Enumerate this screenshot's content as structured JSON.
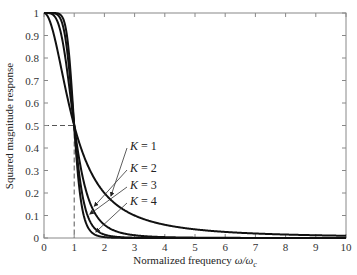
{
  "chart_data": {
    "type": "line",
    "title": "",
    "xlabel": "Normalized frequency ω/ω_c",
    "xlabel_main": "Normalized frequency ",
    "xlabel_omega": "ω/ω",
    "xlabel_sub": "c",
    "ylabel": "Squared magnitude response",
    "xlim": [
      0,
      10
    ],
    "ylim": [
      0,
      1
    ],
    "xticks": [
      0,
      1,
      2,
      3,
      4,
      5,
      6,
      7,
      8,
      9,
      10
    ],
    "yticks": [
      0,
      0.1,
      0.2,
      0.3,
      0.4,
      0.5,
      0.6,
      0.7,
      0.8,
      0.9,
      1
    ],
    "ytick_labels": [
      "0",
      "0.1",
      "0.2",
      "0.3",
      "0.4",
      "0.5",
      "0.6",
      "0.7",
      "0.8",
      "0.9",
      "1"
    ],
    "grid": false,
    "legend": "annotations with arrows",
    "formula": "|H(ω)|² = 1 / (1 + (ω/ω_c)^(2K))",
    "x": [
      0,
      0.5,
      0.8,
      1,
      1.2,
      1.5,
      2,
      3,
      4,
      5,
      6,
      7,
      8,
      9,
      10
    ],
    "series": [
      {
        "name": "K = 1",
        "values": [
          1,
          0.8,
          0.61,
          0.5,
          0.41,
          0.31,
          0.2,
          0.1,
          0.059,
          0.038,
          0.027,
          0.02,
          0.015,
          0.012,
          0.0099
        ]
      },
      {
        "name": "K = 2",
        "values": [
          1,
          0.94,
          0.71,
          0.5,
          0.33,
          0.16,
          0.059,
          0.012,
          0.0039,
          0.0016,
          0.0008,
          0.0004,
          0.0002,
          0.0002,
          0.0001
        ]
      },
      {
        "name": "K = 3",
        "values": [
          1,
          0.98,
          0.79,
          0.5,
          0.25,
          0.081,
          0.015,
          0.0014,
          0.0002,
          0.0001,
          0,
          0,
          0,
          0,
          0
        ]
      },
      {
        "name": "K = 4",
        "values": [
          1,
          1.0,
          0.86,
          0.5,
          0.19,
          0.038,
          0.0039,
          0.0002,
          0,
          0,
          0,
          0,
          0,
          0,
          0
        ]
      }
    ],
    "annotations": [
      {
        "text": "K = 1",
        "K": 1
      },
      {
        "text": "K = 2",
        "K": 2
      },
      {
        "text": "K = 3",
        "K": 3
      },
      {
        "text": "K = 4",
        "K": 4
      }
    ],
    "reference_lines": {
      "cutoff_x": 1,
      "half_power_y": 0.5,
      "style": "dashed"
    }
  }
}
